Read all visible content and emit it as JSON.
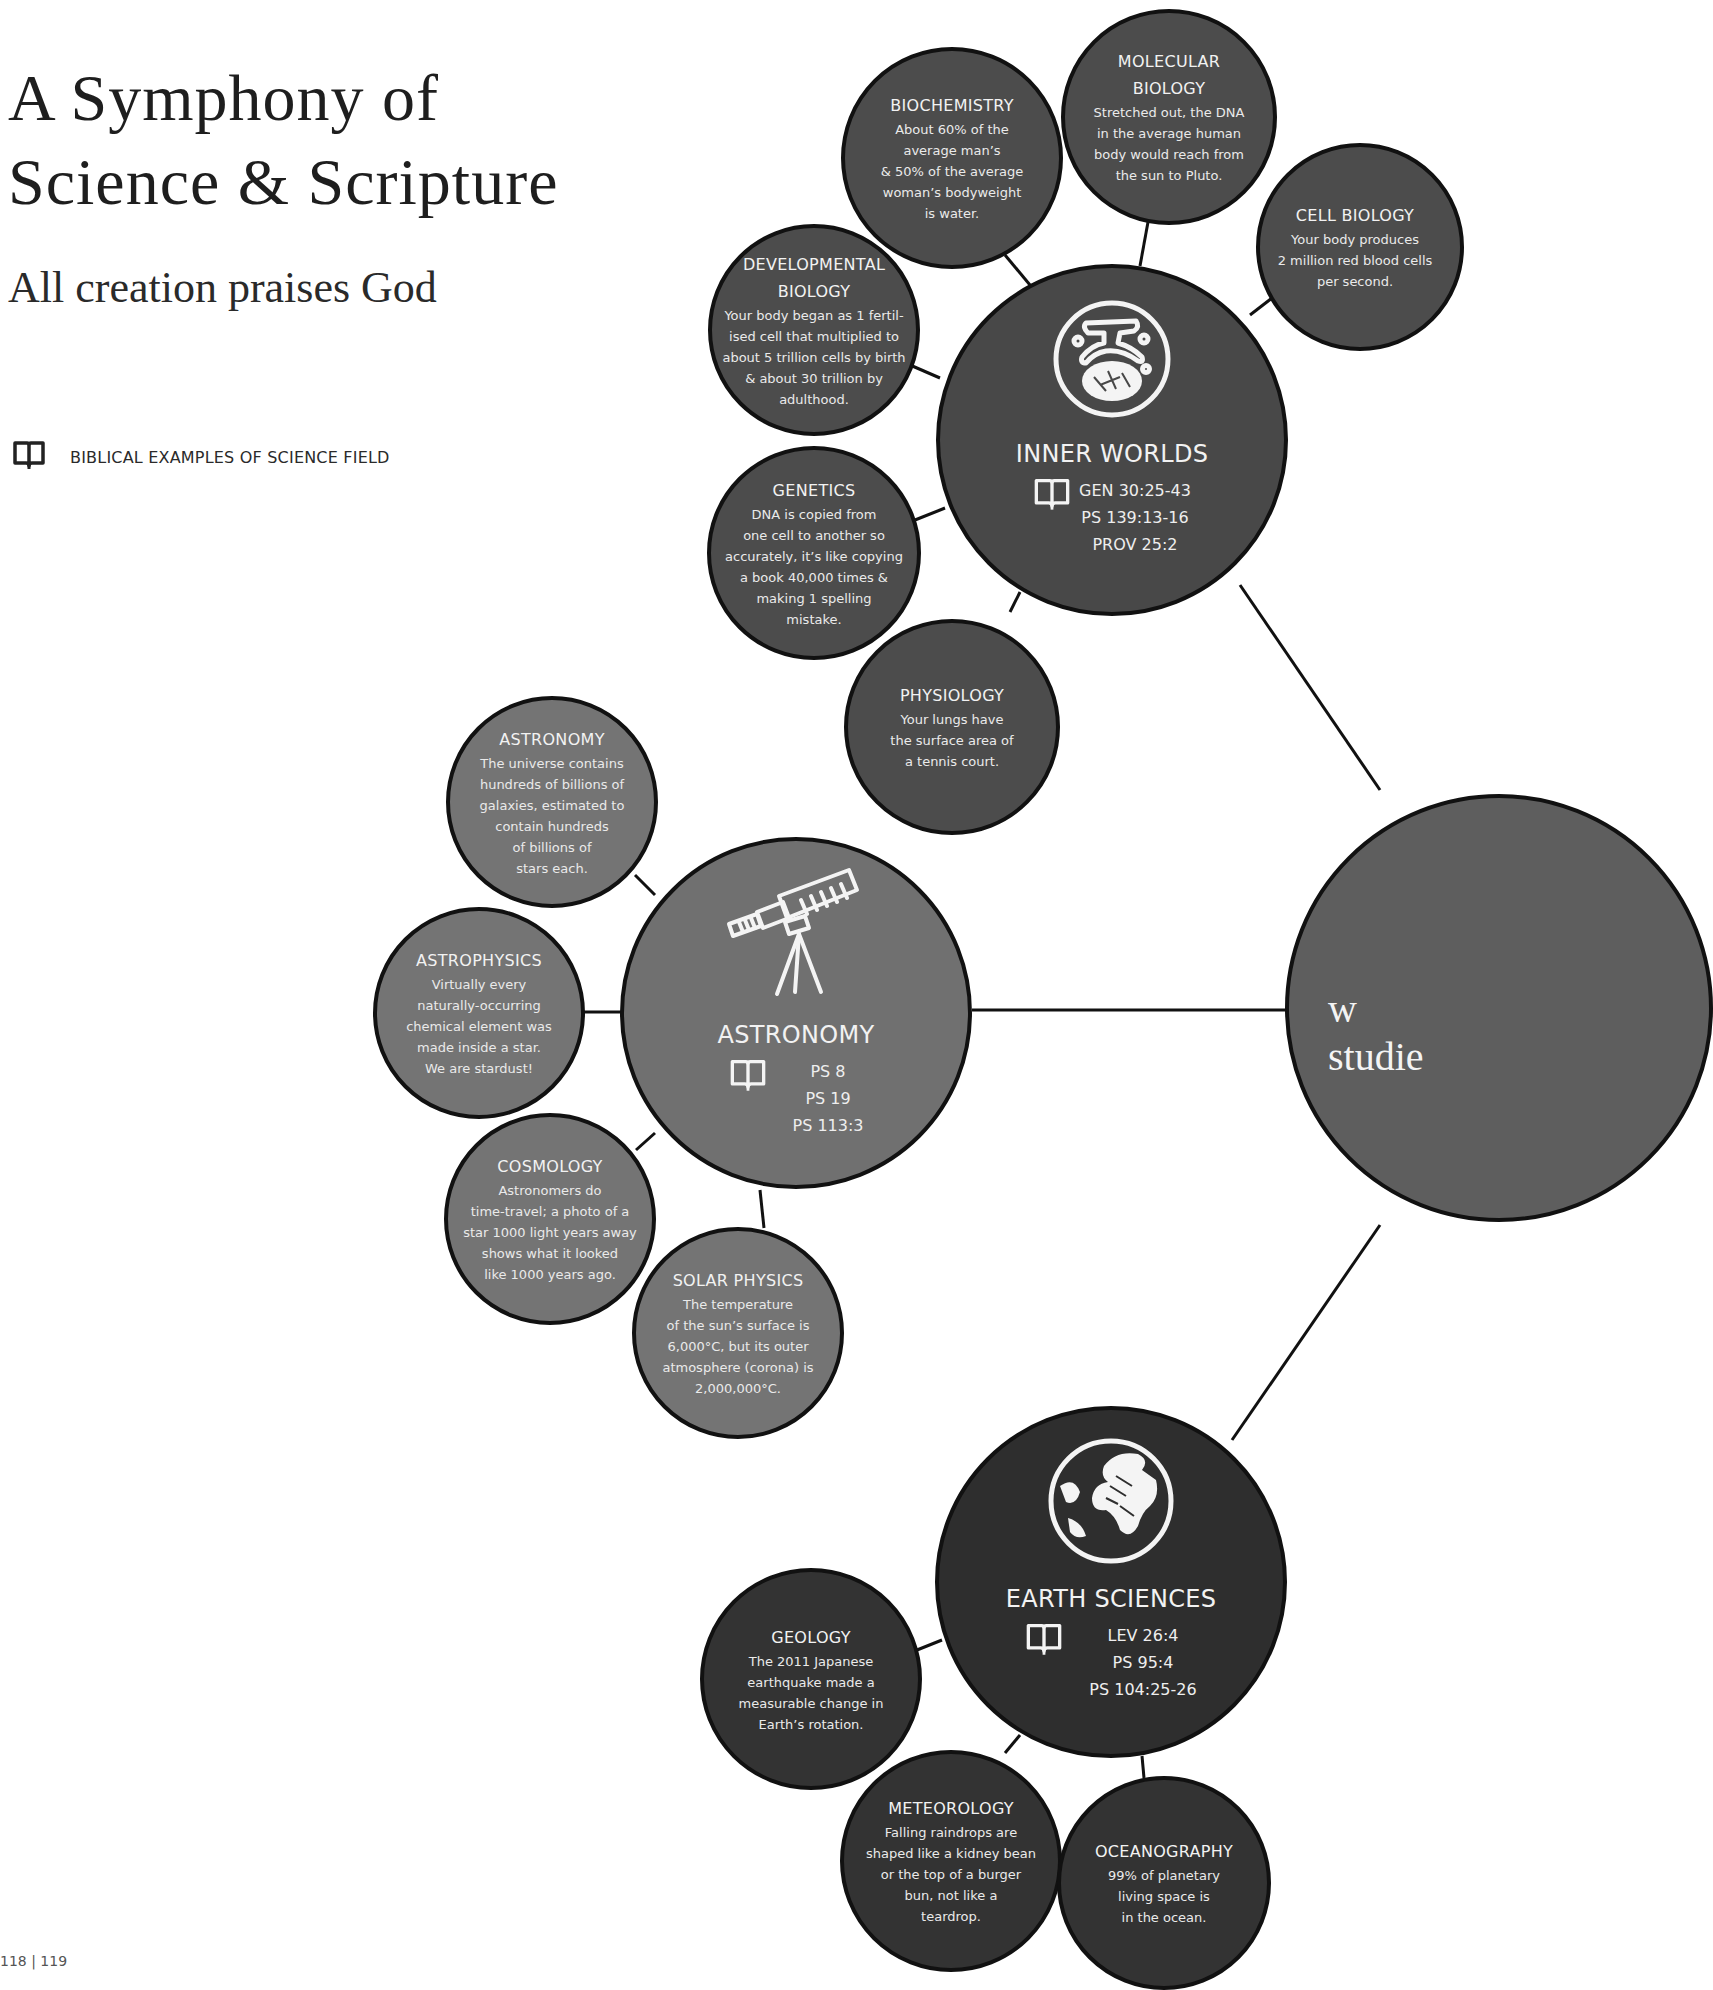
{
  "header": {
    "title_line1": "A Symphony of",
    "title_line2": "Science & Scripture",
    "subtitle": "All creation praises God"
  },
  "legend": {
    "icon": "open-book-icon",
    "label": "BIBLICAL EXAMPLES OF SCIENCE FIELD"
  },
  "page_number": "118 | 119",
  "colors": {
    "inner_worlds_group": "#4a4a4a",
    "astronomy_group": "#727272",
    "earth_sciences_group": "#2e2e2e",
    "central": "#5e5e5e",
    "outline": "#111111",
    "text": "#f2f2f2"
  },
  "central": {
    "text_line1": "w",
    "text_line2": "studie"
  },
  "groups": {
    "inner_worlds": {
      "title": "INNER WORLDS",
      "icon": "cell-icon",
      "refs": [
        "GEN 30:25-43",
        "PS 139:13-16",
        "PROV 25:2"
      ],
      "satellites": [
        {
          "title": "BIOCHEMISTRY",
          "fact": "About 60% of the\naverage man’s\n& 50% of the average\nwoman’s bodyweight\nis water."
        },
        {
          "title": "MOLECULAR\nBIOLOGY",
          "fact": "Stretched out, the DNA\nin the average human\nbody would reach from\nthe sun to Pluto."
        },
        {
          "title": "CELL BIOLOGY",
          "fact": "Your body produces\n2 million red blood cells\nper second."
        },
        {
          "title": "DEVELOPMENTAL\nBIOLOGY",
          "fact": "Your body began as 1 fertil-\nised cell that multiplied to\nabout 5 trillion cells by birth\n& about 30 trillion by\nadulthood."
        },
        {
          "title": "GENETICS",
          "fact": "DNA is copied from\none cell to another so\naccurately, it’s like copying\na book 40,000 times &\nmaking 1 spelling\nmistake."
        },
        {
          "title": "PHYSIOLOGY",
          "fact": "Your lungs have\nthe surface area of\na tennis court."
        }
      ]
    },
    "astronomy": {
      "title": "ASTRONOMY",
      "icon": "telescope-icon",
      "refs": [
        "PS 8",
        "PS 19",
        "PS 113:3"
      ],
      "satellites": [
        {
          "title": "ASTRONOMY",
          "fact": "The universe contains\nhundreds of billions of\ngalaxies, estimated to\ncontain hundreds\nof billions of\nstars each."
        },
        {
          "title": "ASTROPHYSICS",
          "fact": "Virtually every\nnaturally-occurring\nchemical element was\nmade inside a star.\nWe are stardust!"
        },
        {
          "title": "COSMOLOGY",
          "fact": "Astronomers do\ntime-travel; a photo of a\nstar 1000 light years away\nshows what it looked\nlike 1000 years ago."
        },
        {
          "title": "SOLAR PHYSICS",
          "fact": "The temperature\nof the sun’s surface is\n6,000°C, but its outer\natmosphere (corona) is\n2,000,000°C."
        }
      ]
    },
    "earth_sciences": {
      "title": "EARTH SCIENCES",
      "icon": "globe-icon",
      "refs": [
        "LEV 26:4",
        "PS 95:4",
        "PS 104:25-26"
      ],
      "satellites": [
        {
          "title": "GEOLOGY",
          "fact": "The 2011 Japanese\nearthquake made a\nmeasurable change in\nEarth’s rotation."
        },
        {
          "title": "METEOROLOGY",
          "fact": "Falling raindrops are\nshaped like a kidney bean\nor the top of a burger\nbun, not like a\nteardrop."
        },
        {
          "title": "OCEANOGRAPHY",
          "fact": "99% of planetary\nliving space is\nin the ocean."
        }
      ]
    }
  }
}
